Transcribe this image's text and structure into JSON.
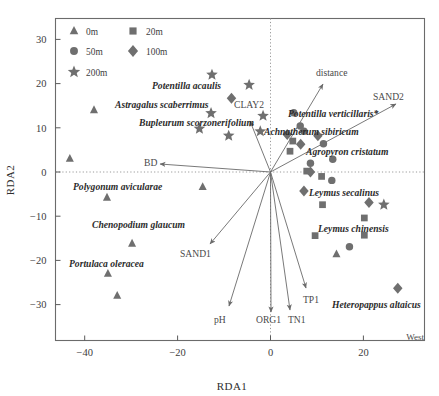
{
  "chart_data": {
    "type": "scatter",
    "title": "",
    "xlabel": "RDA1",
    "ylabel": "RDA2",
    "xlim": [
      -46,
      32
    ],
    "ylim": [
      -35,
      33
    ],
    "xticks": [
      -40,
      -20,
      0,
      20
    ],
    "yticks": [
      30,
      20,
      10,
      0,
      -10,
      -20,
      -30
    ],
    "xticklabels": [
      "−40",
      "−20",
      "0",
      "20"
    ],
    "yticklabels": [
      "30",
      "20",
      "10",
      "0",
      "−10",
      "−20",
      "−30"
    ],
    "grid": false,
    "zero_lines": true,
    "legend_position": "top-left",
    "corner_annotation": "West",
    "marker_color": "#6f6f6f",
    "legend": [
      {
        "label": "0m",
        "marker": "triangle"
      },
      {
        "label": "20m",
        "marker": "square"
      },
      {
        "label": "50m",
        "marker": "circle"
      },
      {
        "label": "100m",
        "marker": "diamond"
      },
      {
        "label": "200m",
        "marker": "star"
      }
    ],
    "series": [
      {
        "name": "0m",
        "marker": "triangle",
        "points": [
          {
            "x": -38.0,
            "y": 14.0
          },
          {
            "x": -43.2,
            "y": 3.0
          },
          {
            "x": -35.2,
            "y": -5.8
          },
          {
            "x": -29.8,
            "y": -16.2
          },
          {
            "x": -35.0,
            "y": -23.0
          },
          {
            "x": -33.0,
            "y": -28.0
          },
          {
            "x": -14.6,
            "y": -3.4
          },
          {
            "x": 14.2,
            "y": -18.6
          }
        ]
      },
      {
        "name": "20m",
        "marker": "square",
        "points": [
          {
            "x": 4.8,
            "y": 7.0
          },
          {
            "x": 4.2,
            "y": 4.7
          },
          {
            "x": 7.8,
            "y": 0.2
          },
          {
            "x": 11.0,
            "y": -1.0
          },
          {
            "x": 11.2,
            "y": -7.4
          },
          {
            "x": 9.6,
            "y": -14.4
          },
          {
            "x": 20.2,
            "y": -10.4
          },
          {
            "x": 20.2,
            "y": -14.3
          }
        ]
      },
      {
        "name": "50m",
        "marker": "circle",
        "points": [
          {
            "x": 5.0,
            "y": 13.4
          },
          {
            "x": 6.4,
            "y": 10.4
          },
          {
            "x": 7.2,
            "y": 9.2
          },
          {
            "x": 11.4,
            "y": 6.4
          },
          {
            "x": 8.6,
            "y": 2.0
          },
          {
            "x": 13.4,
            "y": 2.9
          },
          {
            "x": 13.2,
            "y": -1.9
          },
          {
            "x": 17.0,
            "y": -16.9
          }
        ]
      },
      {
        "name": "100m",
        "marker": "diamond",
        "points": [
          {
            "x": -8.4,
            "y": 16.7
          },
          {
            "x": 3.6,
            "y": 8.5
          },
          {
            "x": 6.5,
            "y": 6.3
          },
          {
            "x": 10.2,
            "y": 8.2
          },
          {
            "x": 8.6,
            "y": 0.0
          },
          {
            "x": 7.2,
            "y": -4.3
          },
          {
            "x": 21.2,
            "y": -6.9
          },
          {
            "x": 27.4,
            "y": -26.3
          }
        ]
      },
      {
        "name": "200m",
        "marker": "star",
        "points": [
          {
            "x": -12.6,
            "y": 22.0
          },
          {
            "x": -4.6,
            "y": 19.7
          },
          {
            "x": -12.8,
            "y": 13.3
          },
          {
            "x": -1.6,
            "y": 12.7
          },
          {
            "x": -2.2,
            "y": 9.2
          },
          {
            "x": -15.3,
            "y": 9.8
          },
          {
            "x": -9.0,
            "y": 8.2
          },
          {
            "x": 24.4,
            "y": -7.4
          }
        ]
      }
    ],
    "species_labels": [
      {
        "text": "Potentilla acaulis",
        "x": 152,
        "y": 89,
        "anchor": "start"
      },
      {
        "text": "Astragalus scaberrimus",
        "x": 115,
        "y": 108,
        "anchor": "start"
      },
      {
        "text": "Bupleurum scorzonerifolium",
        "x": 139,
        "y": 126,
        "anchor": "start"
      },
      {
        "text": "Potentilla verticillaris*",
        "x": 288,
        "y": 117,
        "anchor": "start"
      },
      {
        "text": "Achnatherum sibiricum",
        "x": 264,
        "y": 135,
        "anchor": "start"
      },
      {
        "text": "Agropyron cristatum",
        "x": 306,
        "y": 155,
        "anchor": "start"
      },
      {
        "text": "Polygonum avicularae",
        "x": 73,
        "y": 190,
        "anchor": "start"
      },
      {
        "text": "Chenopodium glaucum",
        "x": 92,
        "y": 228,
        "anchor": "start"
      },
      {
        "text": "Portulaca oleracea",
        "x": 69,
        "y": 267,
        "anchor": "start"
      },
      {
        "text": "Leymus secalinus",
        "x": 309,
        "y": 196,
        "anchor": "start"
      },
      {
        "text": "Leymus chinensis",
        "x": 318,
        "y": 232,
        "anchor": "start"
      },
      {
        "text": "Heteropappus altaicus",
        "x": 332,
        "y": 308,
        "anchor": "start"
      }
    ],
    "env_vectors": [
      {
        "name": "distance",
        "tip_x": 323,
        "tip_y": 84,
        "label_x": 316,
        "label_y": 76,
        "anchor": "start"
      },
      {
        "name": "SAND2",
        "tip_x": 396,
        "tip_y": 104,
        "label_x": 373,
        "label_y": 100,
        "anchor": "start"
      },
      {
        "name": "CLAY2",
        "tip_x": 250,
        "tip_y": 121,
        "label_x": 234,
        "label_y": 108,
        "anchor": "start"
      },
      {
        "name": "BD",
        "tip_x": 160,
        "tip_y": 164,
        "label_x": 144,
        "label_y": 166,
        "anchor": "start"
      },
      {
        "name": "SAND1",
        "tip_x": 210,
        "tip_y": 244,
        "label_x": 180,
        "label_y": 257,
        "anchor": "start"
      },
      {
        "name": "pH",
        "tip_x": 229,
        "tip_y": 306,
        "label_x": 214,
        "label_y": 323,
        "anchor": "start"
      },
      {
        "name": "ORG1",
        "tip_x": 271,
        "tip_y": 312,
        "label_x": 256,
        "label_y": 323,
        "anchor": "start"
      },
      {
        "name": "TN1",
        "tip_x": 290,
        "tip_y": 310,
        "label_x": 288,
        "label_y": 323,
        "anchor": "start"
      },
      {
        "name": "TP1",
        "tip_x": 306,
        "tip_y": 288,
        "label_x": 303,
        "label_y": 303,
        "anchor": "start"
      }
    ],
    "origin_px": {
      "x": 270.5,
      "y": 172.0
    }
  }
}
